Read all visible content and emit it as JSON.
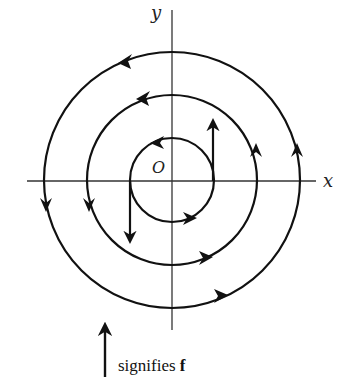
{
  "diagram": {
    "type": "vector-field-spiral",
    "axes": {
      "x_label": "x",
      "y_label": "y",
      "origin_label": "O"
    },
    "circles": [
      {
        "name": "inner",
        "radius": 42,
        "direction": "counterclockwise"
      },
      {
        "name": "middle",
        "radius": 85,
        "direction": "counterclockwise"
      },
      {
        "name": "outer",
        "radius": 128,
        "direction": "counterclockwise"
      }
    ],
    "vector_arrows": [
      {
        "position": "right of inner circle",
        "direction": "up"
      },
      {
        "position": "left of inner circle",
        "direction": "down"
      }
    ],
    "legend": {
      "text": "signifies ",
      "symbol": "f"
    },
    "colors": {
      "stroke": "#111111",
      "axis": "#333333",
      "background": "#ffffff"
    }
  }
}
